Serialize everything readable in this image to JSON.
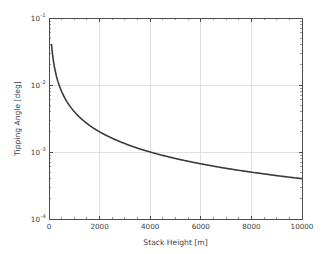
{
  "chart_data": {
    "type": "line",
    "title": "",
    "xlabel": "Stack Height [m]",
    "ylabel": "Tipping Angle [deg]",
    "xscale": "linear",
    "yscale": "log",
    "xlim": [
      0,
      10000
    ],
    "ylim": [
      0.0001,
      0.1
    ],
    "grid": true,
    "legend": null,
    "xticks": [
      0,
      2000,
      4000,
      6000,
      8000,
      10000
    ],
    "xticklabels": [
      "0",
      "2000",
      "4000",
      "6000",
      "8000",
      "10000"
    ],
    "yticks": [
      0.1,
      0.01,
      0.001,
      0.0001
    ],
    "yticklabels": [
      "10⁻¹",
      "10⁻²",
      "10⁻³",
      "10⁻⁴"
    ],
    "ytick_mantissa": [
      "10",
      "10",
      "10",
      "10"
    ],
    "ytick_exponents": [
      "-1",
      "-2",
      "-3",
      "-4"
    ],
    "line_color": "#3a3a3a",
    "grid_color": "#d8d8d8",
    "axis_color": "#4d4d4d",
    "background_color": "#ffffff",
    "series": [
      {
        "name": "Tipping Angle",
        "x": [
          100,
          150,
          200,
          250,
          300,
          350,
          400,
          500,
          600,
          700,
          800,
          900,
          1000,
          1200,
          1400,
          1600,
          1800,
          2000,
          2400,
          2800,
          3200,
          3600,
          4000,
          4500,
          5000,
          5500,
          6000,
          6500,
          7000,
          7500,
          8000,
          8500,
          9000,
          9500,
          10000
        ],
        "y": [
          0.04,
          0.0268,
          0.02,
          0.016,
          0.0133,
          0.0114,
          0.01,
          0.008,
          0.00665,
          0.0057,
          0.005,
          0.00444,
          0.004,
          0.00333,
          0.00286,
          0.0025,
          0.00222,
          0.002,
          0.00167,
          0.00143,
          0.00125,
          0.00111,
          0.001,
          0.000889,
          0.0008,
          0.000727,
          0.000667,
          0.000615,
          0.000571,
          0.000533,
          0.0005,
          0.000471,
          0.000444,
          0.000421,
          0.0004
        ]
      }
    ]
  },
  "axes": {
    "xlabel": "Stack Height [m]",
    "ylabel": "Tipping Angle [deg]"
  }
}
